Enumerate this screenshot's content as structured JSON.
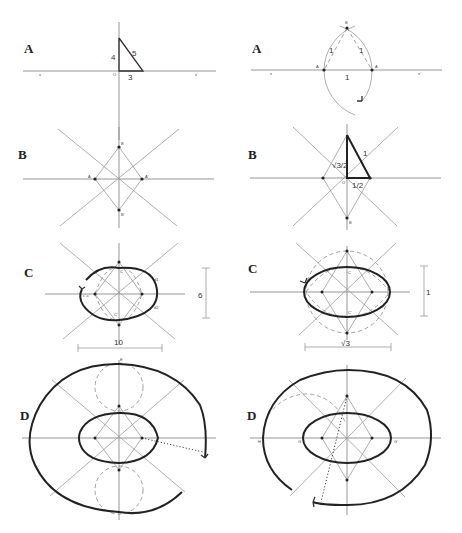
{
  "figure": {
    "layout": "4 rows x 2 columns of geometric construction panels (oval/ellipse construction)",
    "left_column": {
      "A": {
        "label": "A",
        "points": {
          "origin": "O",
          "left_axis": "x",
          "right_axis": "x'"
        },
        "triangle_sides": {
          "vertical": "4",
          "horizontal": "3",
          "hypotenuse": "5"
        }
      },
      "B": {
        "label": "B",
        "points": {
          "top": "B",
          "bottom": "B'",
          "left": "A",
          "right": "A'"
        }
      },
      "C": {
        "label": "C",
        "points": {
          "top": "C",
          "bottom": "C'",
          "arc_upper": "d1",
          "arc_lower": "d2",
          "left_arc": "c'-c'"
        },
        "dimensions": {
          "width": "10",
          "height": "6"
        }
      },
      "D": {
        "label": "D",
        "points": {
          "top": "E"
        }
      }
    },
    "right_column": {
      "A": {
        "label": "A",
        "points": {
          "apex": "B",
          "left": "A",
          "right": "A",
          "left_axis": "x",
          "right_axis": "x'"
        },
        "triangle_sides": {
          "left": "1",
          "right": "1",
          "base": "1"
        }
      },
      "B": {
        "label": "B",
        "points": {
          "origin": "O",
          "bottom": "B"
        },
        "triangle_sides": {
          "vertical": "√3/2",
          "horizontal": "1/2",
          "hypotenuse": "1"
        }
      },
      "C": {
        "label": "C",
        "points": {
          "top": "C",
          "bottom": "C'"
        },
        "dimensions": {
          "width": "√3",
          "height": "1"
        }
      },
      "D": {
        "label": "D",
        "points": {
          "far_left": "H",
          "left": "G",
          "right": "G'"
        }
      }
    }
  }
}
